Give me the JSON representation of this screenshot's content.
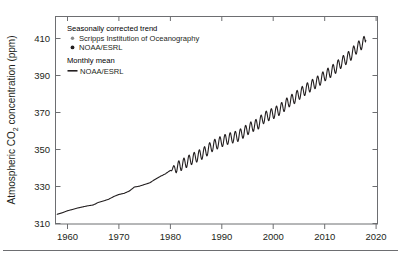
{
  "figure": {
    "name": "atmospheric-co2-concentration-chart",
    "background": "#ffffff",
    "axis_color": "#6d6e71",
    "text_color": "#231f20"
  },
  "axes": {
    "ylabel": "Atmospheric CO",
    "ylabel_sub": "2",
    "ylabel_tail": " concentration (ppm)",
    "ylabel_full": "Atmospheric CO2 concentration (ppm)",
    "xlabel": "",
    "yticks": [
      "310",
      "330",
      "350",
      "370",
      "390",
      "410"
    ],
    "xticks": [
      "1960",
      "1970",
      "1980",
      "1990",
      "2000",
      "2010",
      "2020"
    ]
  },
  "legend": {
    "position": "top-left-inside",
    "group_trend_title": "Seasonally corrected trend",
    "group_trend_items": [
      {
        "label": "Scripps Institution of Oceanography",
        "marker": "dot-icon",
        "color": "#8a8a8a"
      },
      {
        "label": "NOAA/ESRL",
        "marker": "dot-icon",
        "color": "#231f20"
      }
    ],
    "group_monthly_title": "Monthly mean",
    "group_monthly_items": [
      {
        "label": "NOAA/ESRL",
        "marker": "line-icon",
        "color": "#231f20"
      }
    ]
  },
  "chart_data": {
    "type": "line",
    "title": "",
    "xlabel": "",
    "ylabel": "Atmospheric CO2 concentration (ppm)",
    "xlim": [
      1958,
      2022
    ],
    "ylim": [
      307,
      414
    ],
    "grid": false,
    "legend_position": "top-left",
    "tick_values_y": [
      310,
      330,
      350,
      370,
      390,
      410
    ],
    "tick_values_x": [
      1960,
      1970,
      1980,
      1990,
      2000,
      2010,
      2020
    ],
    "seasonal_amplitude_ppm": 3.0,
    "seasonal_visible_from_year": 1980,
    "series": [
      {
        "name": "Seasonally corrected trend / Monthly mean",
        "color": "#231f20",
        "x": [
          1958,
          1959,
          1960,
          1961,
          1962,
          1963,
          1964,
          1965,
          1966,
          1967,
          1968,
          1969,
          1970,
          1971,
          1972,
          1973,
          1974,
          1975,
          1976,
          1977,
          1978,
          1979,
          1980,
          1981,
          1982,
          1983,
          1984,
          1985,
          1986,
          1987,
          1988,
          1989,
          1990,
          1991,
          1992,
          1993,
          1994,
          1995,
          1996,
          1997,
          1998,
          1999,
          2000,
          2001,
          2002,
          2003,
          2004,
          2005,
          2006,
          2007,
          2008,
          2009,
          2010,
          2011,
          2012,
          2013,
          2014,
          2015,
          2016,
          2017,
          2018
        ],
        "values": [
          315.0,
          315.8,
          316.9,
          317.6,
          318.4,
          319.0,
          319.6,
          320.0,
          321.4,
          322.2,
          323.1,
          324.6,
          325.7,
          326.3,
          327.5,
          329.7,
          330.2,
          331.1,
          332.0,
          333.8,
          335.4,
          336.8,
          338.7,
          340.1,
          341.4,
          343.0,
          344.6,
          346.0,
          347.4,
          349.2,
          351.6,
          353.1,
          354.4,
          355.6,
          356.4,
          357.1,
          358.8,
          360.8,
          362.6,
          363.7,
          366.7,
          368.4,
          369.5,
          371.1,
          373.2,
          375.8,
          377.5,
          379.8,
          381.9,
          383.8,
          385.6,
          387.4,
          389.9,
          391.6,
          393.8,
          396.5,
          398.6,
          400.8,
          404.2,
          406.6,
          409.0
        ]
      }
    ]
  }
}
